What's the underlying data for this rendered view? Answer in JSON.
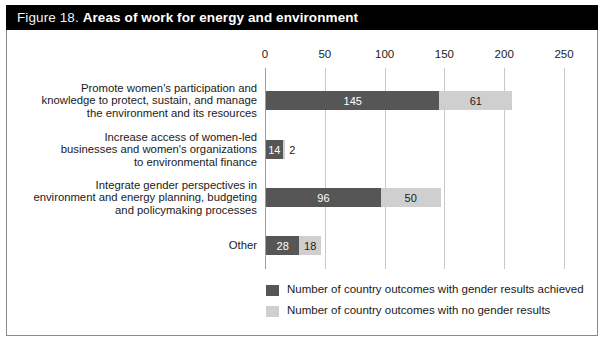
{
  "figure": {
    "label": "Figure 18.",
    "title": "Areas of work for energy and environment"
  },
  "colors": {
    "title_bar_background": "#000000",
    "title_text": "#ffffff",
    "series_achieved": "#565656",
    "series_no_results": "#cfcfcf",
    "gridline": "#c8c8c8",
    "axis": "#9d9d9d",
    "frame_border": "#8a8a8a",
    "plot_background": "#ffffff"
  },
  "chart_data": {
    "type": "bar",
    "orientation": "horizontal",
    "stacked": true,
    "title": "Areas of work for energy and environment",
    "xlabel": "",
    "ylabel": "",
    "xlim": [
      0,
      250
    ],
    "xticks": [
      0,
      50,
      100,
      150,
      200,
      250
    ],
    "grid": true,
    "legend_position": "bottom-left",
    "categories": [
      "Promote women's participation and knowledge to protect, sustain, and manage the environment and its resources",
      "Increase access of women-led businesses and women's organizations to environmental finance",
      "Integrate gender perspectives in environment and energy planning, budgeting and policymaking processes",
      "Other"
    ],
    "category_lines": [
      [
        "Promote women's participation and",
        "knowledge to protect, sustain, and manage",
        "the environment and its resources"
      ],
      [
        "Increase access of women-led",
        "businesses and women's organizations",
        "to environmental finance"
      ],
      [
        "Integrate gender perspectives in",
        "environment and energy planning, budgeting",
        "and policymaking processes"
      ],
      [
        "Other"
      ]
    ],
    "series": [
      {
        "name": "Number of country outcomes with gender results achieved",
        "color": "#565656",
        "values": [
          145,
          14,
          96,
          28
        ]
      },
      {
        "name": "Number of country outcomes with no gender results",
        "color": "#cfcfcf",
        "values": [
          61,
          2,
          50,
          18
        ]
      }
    ],
    "totals": [
      206,
      16,
      146,
      46
    ]
  },
  "axis": {
    "ticks": [
      {
        "value": 0,
        "label": "0"
      },
      {
        "value": 50,
        "label": "50"
      },
      {
        "value": 100,
        "label": "100"
      },
      {
        "value": 150,
        "label": "150"
      },
      {
        "value": 200,
        "label": "200"
      },
      {
        "value": 250,
        "label": "250"
      }
    ]
  },
  "bars": [
    {
      "dark_value": 145,
      "dark_label": "145",
      "dark_label_inside": true,
      "light_value": 61,
      "light_label": "61",
      "light_label_inside": true,
      "top": 91
    },
    {
      "dark_value": 14,
      "dark_label": "14",
      "dark_label_inside": true,
      "light_value": 2,
      "light_label": "2",
      "light_label_inside": false,
      "top": 140
    },
    {
      "dark_value": 96,
      "dark_label": "96",
      "dark_label_inside": true,
      "light_value": 50,
      "light_label": "50",
      "light_label_inside": true,
      "top": 188
    },
    {
      "dark_value": 28,
      "dark_label": "28",
      "dark_label_inside": true,
      "light_value": 18,
      "light_label": "18",
      "light_label_inside": true,
      "top": 236
    }
  ],
  "legend": {
    "items": [
      {
        "label": "Number of country outcomes with gender results achieved",
        "color": "#565656"
      },
      {
        "label": "Number of country outcomes with no gender results",
        "color": "#cfcfcf"
      }
    ]
  }
}
